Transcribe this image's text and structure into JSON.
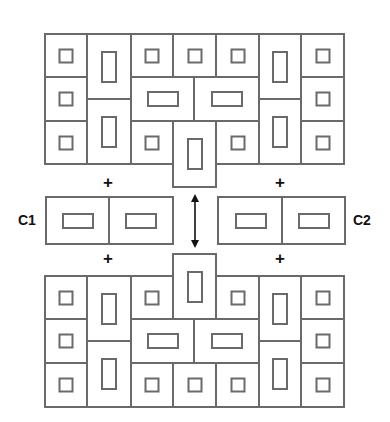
{
  "labels": {
    "c1": "C1",
    "c2": "C2"
  },
  "plus_symbol": "+",
  "colors": {
    "line": "#6a6a6a",
    "text": "#111111",
    "background": "#ffffff"
  },
  "top_grid": [
    {
      "x": 44,
      "y": 33,
      "w": 42,
      "h": 43,
      "inner": "sq"
    },
    {
      "x": 44,
      "y": 76,
      "w": 42,
      "h": 44,
      "inner": "sq"
    },
    {
      "x": 44,
      "y": 120,
      "w": 42,
      "h": 43,
      "inner": "sq"
    },
    {
      "x": 86,
      "y": 33,
      "w": 44,
      "h": 65,
      "inner": "tall"
    },
    {
      "x": 86,
      "y": 98,
      "w": 44,
      "h": 65,
      "inner": "tall"
    },
    {
      "x": 130,
      "y": 33,
      "w": 42,
      "h": 43,
      "inner": "sq"
    },
    {
      "x": 172,
      "y": 33,
      "w": 43,
      "h": 43,
      "inner": "sq"
    },
    {
      "x": 215,
      "y": 33,
      "w": 43,
      "h": 43,
      "inner": "sq"
    },
    {
      "x": 130,
      "y": 76,
      "w": 63,
      "h": 44,
      "inner": "wide"
    },
    {
      "x": 193,
      "y": 76,
      "w": 65,
      "h": 44,
      "inner": "wide"
    },
    {
      "x": 130,
      "y": 120,
      "w": 42,
      "h": 43,
      "inner": "sq"
    },
    {
      "x": 215,
      "y": 120,
      "w": 43,
      "h": 43,
      "inner": "sq"
    },
    {
      "x": 172,
      "y": 120,
      "w": 43,
      "h": 66,
      "inner": "tall"
    },
    {
      "x": 258,
      "y": 33,
      "w": 42,
      "h": 65,
      "inner": "tall"
    },
    {
      "x": 258,
      "y": 98,
      "w": 42,
      "h": 65,
      "inner": "tall"
    },
    {
      "x": 300,
      "y": 33,
      "w": 43,
      "h": 43,
      "inner": "sq"
    },
    {
      "x": 300,
      "y": 76,
      "w": 43,
      "h": 44,
      "inner": "sq"
    },
    {
      "x": 300,
      "y": 120,
      "w": 43,
      "h": 43,
      "inner": "sq"
    }
  ],
  "bottom_grid": [
    {
      "x": 172,
      "y": 253,
      "w": 43,
      "h": 65,
      "inner": "tall"
    },
    {
      "x": 44,
      "y": 275,
      "w": 42,
      "h": 43,
      "inner": "sq"
    },
    {
      "x": 44,
      "y": 318,
      "w": 42,
      "h": 44,
      "inner": "sq"
    },
    {
      "x": 44,
      "y": 362,
      "w": 42,
      "h": 44,
      "inner": "sq"
    },
    {
      "x": 86,
      "y": 275,
      "w": 44,
      "h": 65,
      "inner": "tall"
    },
    {
      "x": 86,
      "y": 340,
      "w": 44,
      "h": 66,
      "inner": "tall"
    },
    {
      "x": 130,
      "y": 275,
      "w": 42,
      "h": 43,
      "inner": "sq"
    },
    {
      "x": 215,
      "y": 275,
      "w": 43,
      "h": 43,
      "inner": "sq"
    },
    {
      "x": 130,
      "y": 318,
      "w": 63,
      "h": 44,
      "inner": "wide"
    },
    {
      "x": 193,
      "y": 318,
      "w": 65,
      "h": 44,
      "inner": "wide"
    },
    {
      "x": 130,
      "y": 362,
      "w": 42,
      "h": 44,
      "inner": "sq"
    },
    {
      "x": 172,
      "y": 362,
      "w": 43,
      "h": 44,
      "inner": "sq"
    },
    {
      "x": 215,
      "y": 362,
      "w": 43,
      "h": 44,
      "inner": "sq"
    },
    {
      "x": 258,
      "y": 275,
      "w": 42,
      "h": 65,
      "inner": "tall"
    },
    {
      "x": 258,
      "y": 340,
      "w": 42,
      "h": 66,
      "inner": "tall"
    },
    {
      "x": 300,
      "y": 275,
      "w": 43,
      "h": 43,
      "inner": "sq"
    },
    {
      "x": 300,
      "y": 318,
      "w": 43,
      "h": 44,
      "inner": "sq"
    },
    {
      "x": 300,
      "y": 362,
      "w": 43,
      "h": 44,
      "inner": "sq"
    }
  ],
  "c1_block": [
    {
      "x": 45,
      "y": 196,
      "w": 64,
      "h": 47,
      "inner": "wide"
    },
    {
      "x": 108,
      "y": 196,
      "w": 64,
      "h": 47,
      "inner": "wide"
    }
  ],
  "c2_block": [
    {
      "x": 217,
      "y": 196,
      "w": 65,
      "h": 47,
      "inner": "wide"
    },
    {
      "x": 281,
      "y": 196,
      "w": 63,
      "h": 47,
      "inner": "wide"
    }
  ],
  "plus_marks": [
    {
      "x": 108,
      "y": 182
    },
    {
      "x": 280,
      "y": 182
    },
    {
      "x": 108,
      "y": 258
    },
    {
      "x": 280,
      "y": 258
    }
  ]
}
